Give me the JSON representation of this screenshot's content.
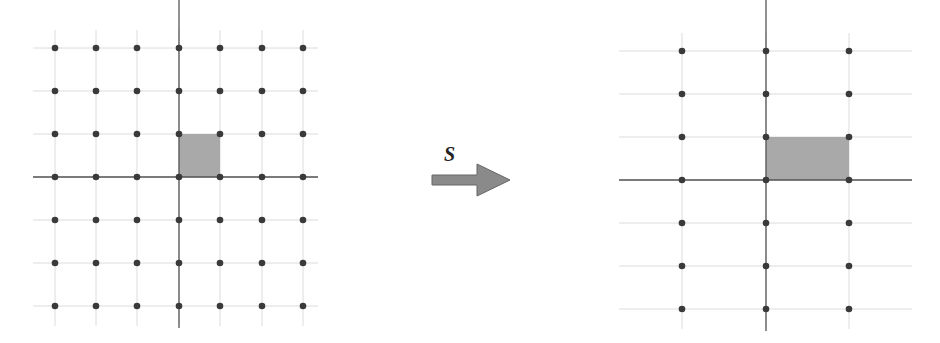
{
  "diagram": {
    "transform_label": "S",
    "colors": {
      "dot": "#3a3a3a",
      "axis": "#555555",
      "grid": "#dcdcdc",
      "cell_fill": "#a9a9a9",
      "arrow_fill": "#8a8a8a",
      "arrow_stroke": "#666666"
    },
    "left_lattice": {
      "name": "original",
      "columns_x": [
        55,
        96,
        137,
        179,
        220,
        262,
        303
      ],
      "rows_y": [
        48,
        91,
        134,
        177,
        220,
        263,
        306
      ],
      "origin": [
        179,
        177
      ],
      "axis_h": [
        33,
        318
      ],
      "axis_v": [
        0,
        328
      ],
      "unit_cell": {
        "x": 179,
        "y": 134,
        "w": 41,
        "h": 43
      }
    },
    "right_lattice": {
      "name": "transformed",
      "columns_x": [
        682,
        766,
        849
      ],
      "rows_y": [
        51,
        94,
        137,
        180,
        223,
        266,
        309
      ],
      "origin": [
        766,
        180
      ],
      "axis_h": [
        619,
        912
      ],
      "axis_v": [
        0,
        331
      ],
      "unit_cell": {
        "x": 766,
        "y": 137,
        "w": 83,
        "h": 43
      }
    },
    "arrow": {
      "x1": 432,
      "x2": 510,
      "y": 180
    }
  }
}
